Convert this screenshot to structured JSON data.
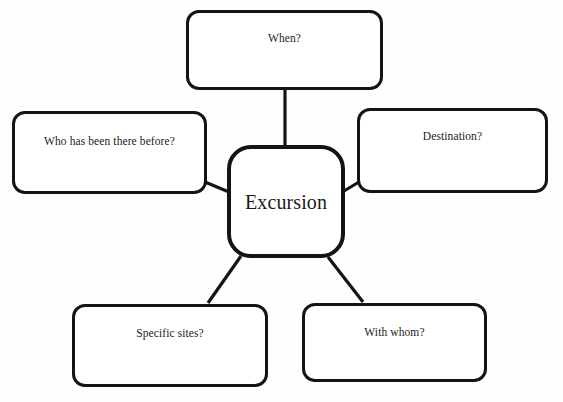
{
  "diagram": {
    "type": "mind-map",
    "title": "Excursion",
    "background_color": "#fefefe",
    "stroke_color": "#141414",
    "fill_color": "#ffffff",
    "center": {
      "label": "Excursion"
    },
    "branches": [
      {
        "id": "top",
        "label": "When?",
        "position": "top"
      },
      {
        "id": "left",
        "label": "Who has been there before?",
        "position": "left"
      },
      {
        "id": "right",
        "label": "Destination?",
        "position": "right"
      },
      {
        "id": "bottomleft",
        "label": "Specific sites?",
        "position": "bottom-left"
      },
      {
        "id": "bottomright",
        "label": "With whom?",
        "position": "bottom-right"
      }
    ]
  }
}
